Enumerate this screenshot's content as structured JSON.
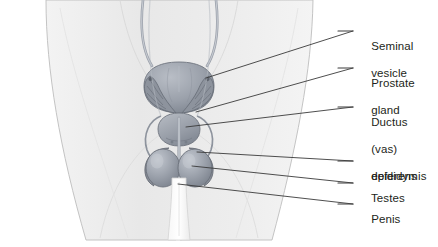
{
  "figure": {
    "background_color": "#ffffff",
    "body_fill": "#ececec",
    "body_outline": "#b9b9b9",
    "organ_fill": "#9a9fa8",
    "organ_outline": "#6f757f",
    "leader_color": "#3a3a3a",
    "text_color": "#231f20"
  },
  "labels": [
    {
      "id": "seminal-vesicle",
      "lines": [
        "Seminal",
        "vesicle"
      ],
      "x": 358,
      "y": 26,
      "leader": {
        "x1": 332,
        "y1": 31,
        "x2": 353,
        "y2": 31,
        "hook_x": 206,
        "hook_y": 78
      }
    },
    {
      "id": "prostate-gland",
      "lines": [
        "Prostate",
        "gland"
      ],
      "x": 358,
      "y": 63,
      "leader": {
        "x1": 332,
        "y1": 68,
        "x2": 353,
        "y2": 68,
        "hook_x": 196,
        "hook_y": 112
      }
    },
    {
      "id": "ductus-deferens",
      "lines": [
        "Ductus",
        "(vas)",
        "deferens"
      ],
      "x": 358,
      "y": 102,
      "leader": {
        "x1": 332,
        "y1": 107,
        "x2": 353,
        "y2": 107,
        "hook_x": 186,
        "hook_y": 127
      }
    },
    {
      "id": "epididymis",
      "lines": [
        "epididymis"
      ],
      "x": 358,
      "y": 156,
      "leader": {
        "x1": 332,
        "y1": 161,
        "x2": 353,
        "y2": 161,
        "hook_x": 197,
        "hook_y": 152
      }
    },
    {
      "id": "testes",
      "lines": [
        "Testes"
      ],
      "x": 358,
      "y": 178,
      "leader": {
        "x1": 332,
        "y1": 183,
        "x2": 353,
        "y2": 183,
        "hook_x": 192,
        "hook_y": 166
      }
    },
    {
      "id": "penis",
      "lines": [
        "Penis"
      ],
      "x": 358,
      "y": 199,
      "leader": {
        "x1": 332,
        "y1": 204,
        "x2": 353,
        "y2": 204,
        "hook_x": 178,
        "hook_y": 184
      }
    }
  ],
  "structures": [
    {
      "id": "ureter-left",
      "name": "ureter"
    },
    {
      "id": "ureter-right",
      "name": "ureter"
    },
    {
      "id": "bladder",
      "name": "urinary bladder"
    },
    {
      "id": "seminal-vesicle-left",
      "name": "seminal vesicle"
    },
    {
      "id": "seminal-vesicle-right",
      "name": "seminal vesicle"
    },
    {
      "id": "prostate",
      "name": "prostate gland"
    },
    {
      "id": "urethra",
      "name": "urethra"
    },
    {
      "id": "vas-left",
      "name": "ductus (vas) deferens"
    },
    {
      "id": "vas-right",
      "name": "ductus (vas) deferens"
    },
    {
      "id": "epididymis-left",
      "name": "epididymis"
    },
    {
      "id": "epididymis-right",
      "name": "epididymis"
    },
    {
      "id": "testis-left",
      "name": "testis"
    },
    {
      "id": "testis-right",
      "name": "testis"
    },
    {
      "id": "penis-shaft",
      "name": "penis"
    }
  ]
}
